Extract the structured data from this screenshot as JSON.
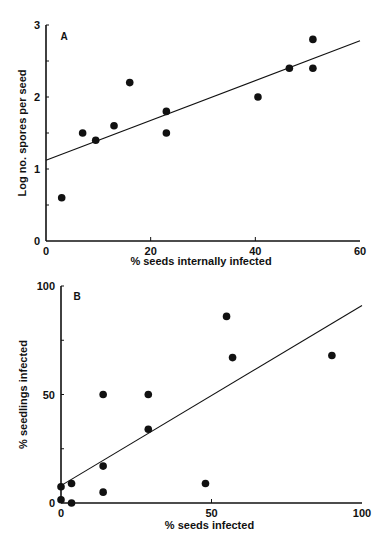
{
  "chart_data": [
    {
      "type": "scatter",
      "panel_label": "A",
      "title": "",
      "xlabel": "% seeds internally infected",
      "ylabel": "Log no. spores per seed",
      "xlim": [
        0,
        60
      ],
      "ylim": [
        0,
        3
      ],
      "xticks": [
        0,
        20,
        40,
        60
      ],
      "yticks": [
        0,
        1,
        2,
        3
      ],
      "ytick_minor": [
        0.5,
        1.5,
        2.5
      ],
      "grid": false,
      "legend": null,
      "points": [
        {
          "x": 3,
          "y": 0.6
        },
        {
          "x": 7,
          "y": 1.5
        },
        {
          "x": 9.5,
          "y": 1.4
        },
        {
          "x": 13,
          "y": 1.6
        },
        {
          "x": 16,
          "y": 2.2
        },
        {
          "x": 23,
          "y": 1.5
        },
        {
          "x": 23,
          "y": 1.8
        },
        {
          "x": 40.5,
          "y": 2.0
        },
        {
          "x": 46.5,
          "y": 2.4
        },
        {
          "x": 51,
          "y": 2.4
        },
        {
          "x": 51,
          "y": 2.8
        }
      ],
      "fit_line": {
        "x0": 0,
        "y0": 1.12,
        "x1": 60,
        "y1": 2.78
      }
    },
    {
      "type": "scatter",
      "panel_label": "B",
      "title": "",
      "xlabel": "% seeds infected",
      "ylabel": "% seedlings infected",
      "xlim": [
        0,
        100
      ],
      "ylim": [
        0,
        100
      ],
      "xticks": [
        0,
        50,
        100
      ],
      "yticks": [
        0,
        50,
        100
      ],
      "ytick_minor": [
        25,
        75
      ],
      "grid": false,
      "legend": null,
      "points": [
        {
          "x": 0,
          "y": 7.5
        },
        {
          "x": 0,
          "y": 1.5
        },
        {
          "x": 3.5,
          "y": 9
        },
        {
          "x": 3.5,
          "y": 0
        },
        {
          "x": 14,
          "y": 50
        },
        {
          "x": 14,
          "y": 17
        },
        {
          "x": 14,
          "y": 5
        },
        {
          "x": 29,
          "y": 50
        },
        {
          "x": 29,
          "y": 34
        },
        {
          "x": 48,
          "y": 9
        },
        {
          "x": 55,
          "y": 86
        },
        {
          "x": 57,
          "y": 67
        },
        {
          "x": 90,
          "y": 68
        }
      ],
      "fit_line": {
        "x0": 0,
        "y0": 8,
        "x1": 100,
        "y1": 91
      }
    }
  ]
}
